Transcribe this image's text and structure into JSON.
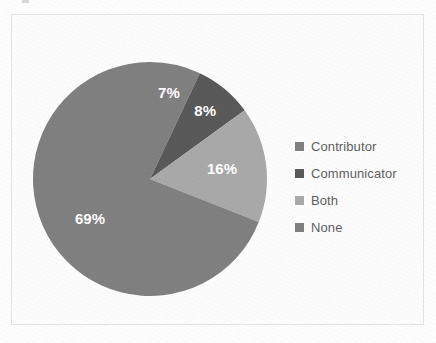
{
  "chart_data": {
    "type": "pie",
    "title": "",
    "subtitle": "",
    "xlabel": "",
    "ylabel": "",
    "grid": false,
    "legend_position": "right",
    "start_angle_deg": 0,
    "direction": "clockwise",
    "categories": [
      "Contributor",
      "Communicator",
      "Both",
      "None"
    ],
    "values": [
      7,
      8,
      16,
      69
    ],
    "value_unit": "%",
    "data_labels": [
      "7%",
      "8%",
      "16%",
      "69%"
    ],
    "colors": [
      "#808080",
      "#595959",
      "#a9a9a9",
      "#808080"
    ],
    "slices": [
      {
        "label": "Contributor",
        "value": 7,
        "data_label": "7%",
        "color": "#808080"
      },
      {
        "label": "Communicator",
        "value": 8,
        "data_label": "8%",
        "color": "#595959"
      },
      {
        "label": "Both",
        "value": 16,
        "data_label": "16%",
        "color": "#a9a9a9"
      },
      {
        "label": "None",
        "value": 69,
        "data_label": "69%",
        "color": "#808080"
      }
    ]
  },
  "legend": {
    "items": [
      {
        "label": "Contributor",
        "color": "#808080"
      },
      {
        "label": "Communicator",
        "color": "#595959"
      },
      {
        "label": "Both",
        "color": "#a9a9a9"
      },
      {
        "label": "None",
        "color": "#808080"
      }
    ]
  },
  "colors": {
    "background": "#ffffff",
    "frame_border": "#e4e4e4",
    "label_text": "#ffffff",
    "legend_text": "#5f5f5f"
  }
}
